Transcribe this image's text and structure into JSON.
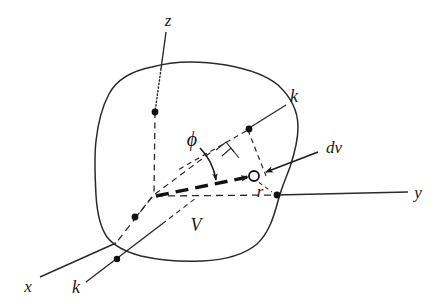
{
  "figure": {
    "kind": "physics-diagram",
    "background_color": "#ffffff",
    "ink_color": "#1a1a1a",
    "width": 439,
    "height": 304
  },
  "labels": {
    "axis_z": "z",
    "axis_y": "y",
    "axis_x": "x",
    "k_upper": "k",
    "k_lower": "k",
    "phi": "ϕ",
    "dv": "dv",
    "r": "r",
    "volume": "V"
  },
  "label_positions": {
    "axis_z": {
      "x": 168,
      "y": 22
    },
    "axis_y": {
      "x": 418,
      "y": 196
    },
    "axis_x": {
      "x": 28,
      "y": 288
    },
    "k_upper": {
      "x": 292,
      "y": 99
    },
    "k_lower": {
      "x": 74,
      "y": 289
    },
    "phi": {
      "x": 193,
      "y": 140
    },
    "dv": {
      "x": 326,
      "y": 150
    },
    "r": {
      "x": 260,
      "y": 193
    },
    "volume": {
      "x": 196,
      "y": 226
    }
  },
  "elements": {
    "origin": {
      "x": 154,
      "y": 196
    },
    "dv_point": {
      "x": 253,
      "y": 176
    },
    "dot_z_axis": {
      "x": 154,
      "y": 111
    },
    "dot_k_upper": {
      "x": 249,
      "y": 128
    },
    "dot_y_axis": {
      "x": 277,
      "y": 196
    },
    "dot_x_axis": {
      "x": 135,
      "y": 217
    },
    "dot_k_lower": {
      "x": 116,
      "y": 242
    },
    "right_angle_marker": true,
    "phi_arc_arrow": true,
    "r_vector_arrow": true,
    "dv_leader_arrow": true,
    "k_leader_lines": 2
  },
  "geometry": {
    "volume_outline_path": "M 154 68 C 180 62 206 63 228 67 C 252 71 268 76 279 86 C 292 98 298 112 298 128 C 298 146 293 160 288 172 C 283 184 278 196 276 208 C 273 222 268 236 256 246 C 242 257 222 261 200 262 C 178 263 156 260 138 255 C 122 250 110 244 104 234 C 98 224 96 210 95 194 C 94 176 94 158 96 142 C 98 124 101 108 108 95 C 116 80 132 72 154 68 Z",
    "z_axis": {
      "x1": 167,
      "y1": 33,
      "x2": 154,
      "y2": 196
    },
    "y_axis": {
      "x1": 154,
      "y1": 196,
      "x2": 410,
      "y2": 192
    },
    "x_axis": {
      "x1": 154,
      "y1": 196,
      "x2": 38,
      "y2": 280
    },
    "k_line_upper": {
      "x1": 285,
      "y1": 106,
      "x2": 225,
      "y2": 147
    },
    "k_line_lower": {
      "x1": 88,
      "y1": 281,
      "x2": 160,
      "y2": 226
    },
    "r_vector": {
      "x1": 154,
      "y1": 196,
      "x2": 250,
      "y2": 177
    }
  }
}
